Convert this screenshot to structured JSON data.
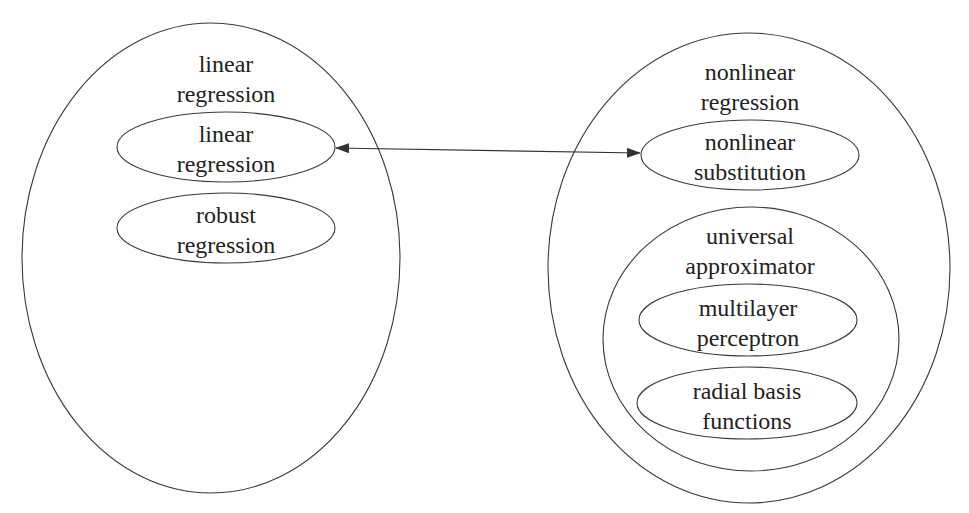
{
  "diagram": {
    "groups": [
      {
        "id": "linear-regression-group",
        "label_lines": [
          "linear",
          "regression"
        ],
        "children": [
          {
            "id": "linear-regression-node",
            "label_lines": [
              "linear",
              "regression"
            ]
          },
          {
            "id": "robust-regression-node",
            "label_lines": [
              "robust",
              "regression"
            ]
          }
        ]
      },
      {
        "id": "nonlinear-regression-group",
        "label_lines": [
          "nonlinear",
          "regression"
        ],
        "children": [
          {
            "id": "nonlinear-substitution-node",
            "label_lines": [
              "nonlinear",
              "substitution"
            ]
          },
          {
            "id": "universal-approximator-group",
            "label_lines": [
              "universal",
              "approximator"
            ],
            "children": [
              {
                "id": "multilayer-perceptron-node",
                "label_lines": [
                  "multilayer",
                  "perceptron"
                ]
              },
              {
                "id": "radial-basis-functions-node",
                "label_lines": [
                  "radial basis",
                  "functions"
                ]
              }
            ]
          }
        ]
      }
    ],
    "edges": [
      {
        "from": "linear-regression-node",
        "to": "nonlinear-substitution-node",
        "direction": "bidirectional"
      }
    ],
    "colors": {
      "stroke": "#3a3a3a",
      "text": "#222222",
      "background": "#ffffff"
    }
  }
}
